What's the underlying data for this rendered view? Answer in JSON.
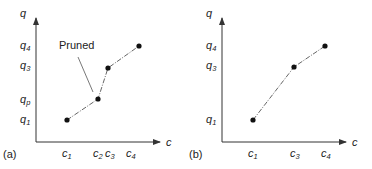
{
  "panels": [
    {
      "id": "a",
      "panel_label": "(a)",
      "y_axis_label": "q",
      "x_axis_label": "c",
      "annotation": "Pruned",
      "y_ticks": [
        {
          "base": "q",
          "sub": "4"
        },
        {
          "base": "q",
          "sub": "3"
        },
        {
          "base": "q",
          "sub": "p"
        },
        {
          "base": "q",
          "sub": "1"
        }
      ],
      "x_ticks": [
        {
          "base": "c",
          "sub": "1"
        },
        {
          "base": "c",
          "sub": "2"
        },
        {
          "base": "c",
          "sub": "3"
        },
        {
          "base": "c",
          "sub": "4"
        }
      ],
      "points": [
        {
          "c": "c1",
          "q": "q1"
        },
        {
          "c": "c2",
          "q": "qp"
        },
        {
          "c": "c3",
          "q": "q3"
        },
        {
          "c": "c4",
          "q": "q4"
        }
      ]
    },
    {
      "id": "b",
      "panel_label": "(b)",
      "y_axis_label": "q",
      "x_axis_label": "c",
      "y_ticks": [
        {
          "base": "q",
          "sub": "4"
        },
        {
          "base": "q",
          "sub": "3"
        },
        {
          "base": "q",
          "sub": "1"
        }
      ],
      "x_ticks": [
        {
          "base": "c",
          "sub": "1"
        },
        {
          "base": "c",
          "sub": "3"
        },
        {
          "base": "c",
          "sub": "4"
        }
      ],
      "points": [
        {
          "c": "c1",
          "q": "q1"
        },
        {
          "c": "c3",
          "q": "q3"
        },
        {
          "c": "c4",
          "q": "q4"
        }
      ]
    }
  ],
  "colors": {
    "axis": "#333333",
    "line": "#666666",
    "point": "#111111",
    "text": "#222222"
  }
}
